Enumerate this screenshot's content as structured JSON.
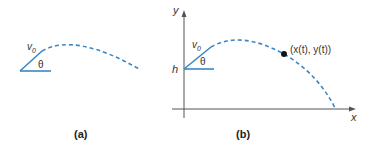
{
  "colors": {
    "trajectory": "#3a87c8",
    "axis": "#555555",
    "text": "#333333"
  },
  "panel_a": {
    "caption": "(a)",
    "velocity_label": "v",
    "velocity_subscript": "0",
    "angle_label": "θ"
  },
  "panel_b": {
    "caption": "(b)",
    "y_axis_label": "y",
    "x_axis_label": "x",
    "height_label": "h",
    "velocity_label": "v",
    "velocity_subscript": "0",
    "angle_label": "θ",
    "point_label": "(x(t), y(t))"
  }
}
